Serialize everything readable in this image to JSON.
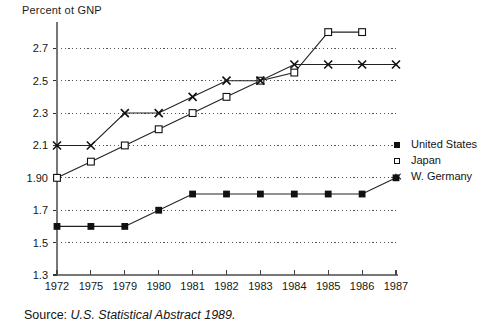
{
  "figure": {
    "axis_title": "Percent ot GNP",
    "source_prefix": "Source:",
    "source_italic": "U.S. Statistical Abstract 1989."
  },
  "legend": {
    "position": "right",
    "items": [
      {
        "label": "United States",
        "marker": "filled-square-marker",
        "color": "#111111"
      },
      {
        "label": "Japan",
        "marker": "open-square-marker",
        "color": "#111111"
      },
      {
        "label": "W. Germany",
        "marker": "x-marker",
        "color": "#111111"
      }
    ]
  },
  "chart_data": {
    "type": "line",
    "title": "Percent ot GNP",
    "xlabel": "",
    "ylabel": "Percent ot GNP",
    "x": [
      "1972",
      "1975",
      "1979",
      "1980",
      "1981",
      "1982",
      "1983",
      "1984",
      "1985",
      "1986",
      "1987"
    ],
    "categories": [
      "1972",
      "1975",
      "1979",
      "1980",
      "1981",
      "1982",
      "1983",
      "1984",
      "1985",
      "1986",
      "1987"
    ],
    "ylim": [
      1.3,
      2.8
    ],
    "yticks": [
      "1.3",
      "1.5",
      "1.7",
      "1.90",
      "2.1",
      "2.3",
      "2.5",
      "2.7"
    ],
    "ytick_values": [
      1.3,
      1.5,
      1.7,
      1.9,
      2.1,
      2.3,
      2.5,
      2.7
    ],
    "grid": true,
    "grid_style": "dotted-horizontal",
    "legend_position": "right",
    "series": [
      {
        "name": "United States",
        "marker": "filled-square",
        "values": [
          1.6,
          1.6,
          1.6,
          1.7,
          1.8,
          1.8,
          1.8,
          1.8,
          1.8,
          1.8,
          1.9
        ]
      },
      {
        "name": "Japan",
        "marker": "open-square",
        "values": [
          1.9,
          2.0,
          2.1,
          2.2,
          2.3,
          2.4,
          2.5,
          2.55,
          2.8,
          2.8,
          null
        ]
      },
      {
        "name": "W. Germany",
        "marker": "x",
        "values": [
          2.1,
          2.1,
          2.3,
          2.3,
          2.4,
          2.5,
          2.5,
          2.6,
          2.6,
          2.6,
          2.6
        ]
      }
    ]
  },
  "plot_geometry": {
    "left": 57,
    "right": 396,
    "top": 24,
    "bottom": 275,
    "y_top_value": 2.85,
    "y_bottom_value": 1.3
  }
}
